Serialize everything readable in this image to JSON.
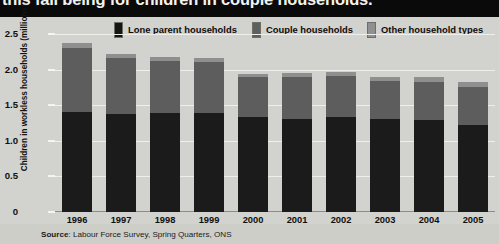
{
  "title": "this fall being for children in couple households.",
  "legend": {
    "items": [
      {
        "label": "Lone parent households",
        "key": "lone_parent",
        "color": "#151515"
      },
      {
        "label": "Couple households",
        "key": "couple",
        "color": "#5f5f5f"
      },
      {
        "label": "Other household types",
        "key": "other",
        "color": "#909090"
      }
    ]
  },
  "source": {
    "prefix": "Source",
    "text": ": Labour Force Survey, Spring Quarters, ONS"
  },
  "chart_data": {
    "type": "bar",
    "stacked": true,
    "title": "this fall being for children in couple households.",
    "xlabel": "",
    "ylabel": "Children in workless households (millions)",
    "ylim": [
      0,
      2.5
    ],
    "yticks": [
      "0",
      "0.5",
      "1.0",
      "1.5",
      "2.0",
      "2.5"
    ],
    "ytick_values": [
      0,
      0.5,
      1.0,
      1.5,
      2.0,
      2.5
    ],
    "grid": true,
    "legend_position": "top",
    "categories": [
      "1996",
      "1997",
      "1998",
      "1999",
      "2000",
      "2001",
      "2002",
      "2003",
      "2004",
      "2005"
    ],
    "series": [
      {
        "name": "Lone parent households",
        "color": "#1b1b1b",
        "values": [
          1.4,
          1.38,
          1.39,
          1.39,
          1.34,
          1.3,
          1.33,
          1.31,
          1.29,
          1.22
        ]
      },
      {
        "name": "Couple households",
        "color": "#5d5d5d",
        "values": [
          0.9,
          0.78,
          0.73,
          0.72,
          0.55,
          0.59,
          0.58,
          0.53,
          0.54,
          0.54
        ]
      },
      {
        "name": "Other household types",
        "color": "#8f8f8f",
        "values": [
          0.07,
          0.06,
          0.06,
          0.06,
          0.05,
          0.06,
          0.06,
          0.05,
          0.06,
          0.06
        ]
      }
    ],
    "totals": [
      2.37,
      2.22,
      2.18,
      2.17,
      1.94,
      1.95,
      1.97,
      1.89,
      1.89,
      1.82
    ]
  }
}
